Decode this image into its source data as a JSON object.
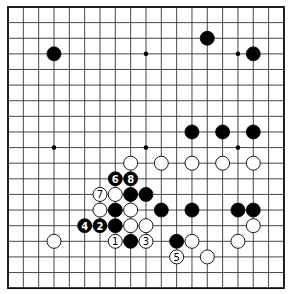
{
  "board": {
    "size": 19,
    "origin_x": 8,
    "origin_y": 7,
    "spacing_x": 15.33,
    "spacing_y": 15.62,
    "stone_radius": 7.0,
    "colors": {
      "line": "#333333",
      "black": "#000000",
      "white": "#ffffff"
    },
    "star_points": [
      [
        3,
        3
      ],
      [
        9,
        3
      ],
      [
        15,
        3
      ],
      [
        3,
        9
      ],
      [
        9,
        9
      ],
      [
        15,
        9
      ],
      [
        3,
        15
      ],
      [
        9,
        15
      ],
      [
        15,
        15
      ]
    ],
    "stones": [
      {
        "col": 3,
        "row": 3,
        "color": "black"
      },
      {
        "col": 13,
        "row": 2,
        "color": "black"
      },
      {
        "col": 16,
        "row": 3,
        "color": "black"
      },
      {
        "col": 12,
        "row": 8,
        "color": "black"
      },
      {
        "col": 14,
        "row": 8,
        "color": "black"
      },
      {
        "col": 16,
        "row": 8,
        "color": "black"
      },
      {
        "col": 8,
        "row": 10,
        "color": "white"
      },
      {
        "col": 10,
        "row": 10,
        "color": "white"
      },
      {
        "col": 12,
        "row": 10,
        "color": "white"
      },
      {
        "col": 14,
        "row": 10,
        "color": "white"
      },
      {
        "col": 16,
        "row": 10,
        "color": "white"
      },
      {
        "col": 7,
        "row": 11,
        "color": "black",
        "label": "6"
      },
      {
        "col": 8,
        "row": 11,
        "color": "black",
        "label": "8"
      },
      {
        "col": 6,
        "row": 12,
        "color": "white",
        "label": "7"
      },
      {
        "col": 7,
        "row": 12,
        "color": "white"
      },
      {
        "col": 8,
        "row": 12,
        "color": "black"
      },
      {
        "col": 9,
        "row": 12,
        "color": "black"
      },
      {
        "col": 6,
        "row": 13,
        "color": "white"
      },
      {
        "col": 7,
        "row": 13,
        "color": "black"
      },
      {
        "col": 8,
        "row": 13,
        "color": "white"
      },
      {
        "col": 10,
        "row": 13,
        "color": "black"
      },
      {
        "col": 12,
        "row": 13,
        "color": "black"
      },
      {
        "col": 15,
        "row": 13,
        "color": "black"
      },
      {
        "col": 16,
        "row": 13,
        "color": "black"
      },
      {
        "col": 5,
        "row": 14,
        "color": "black",
        "label": "4"
      },
      {
        "col": 6,
        "row": 14,
        "color": "black",
        "label": "2"
      },
      {
        "col": 7,
        "row": 14,
        "color": "black"
      },
      {
        "col": 8,
        "row": 14,
        "color": "white"
      },
      {
        "col": 9,
        "row": 14,
        "color": "white"
      },
      {
        "col": 16,
        "row": 14,
        "color": "white"
      },
      {
        "col": 3,
        "row": 15,
        "color": "white"
      },
      {
        "col": 7,
        "row": 15,
        "color": "white",
        "label": "1"
      },
      {
        "col": 8,
        "row": 15,
        "color": "black"
      },
      {
        "col": 9,
        "row": 15,
        "color": "white",
        "label": "3"
      },
      {
        "col": 11,
        "row": 15,
        "color": "black"
      },
      {
        "col": 12,
        "row": 15,
        "color": "white"
      },
      {
        "col": 15,
        "row": 15,
        "color": "white"
      },
      {
        "col": 11,
        "row": 16,
        "color": "white",
        "label": "5"
      },
      {
        "col": 13,
        "row": 16,
        "color": "white"
      }
    ]
  }
}
